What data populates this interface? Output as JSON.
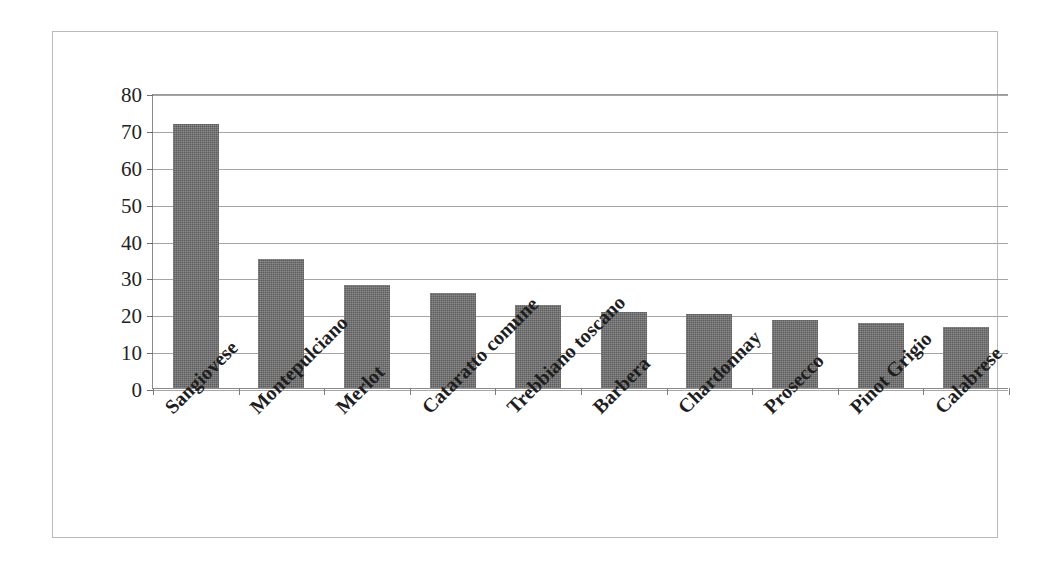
{
  "chart_data": {
    "type": "bar",
    "title": "",
    "subtitle": "",
    "xlabel": "",
    "ylabel": "",
    "ylim": [
      0,
      80
    ],
    "ytick_values": [
      80,
      70,
      60,
      50,
      40,
      30,
      20,
      10,
      0
    ],
    "ytick_labels": [
      "80",
      "70",
      "60",
      "50",
      "40",
      "30",
      "20",
      "10",
      "0"
    ],
    "grid": "horizontal",
    "legend": "none",
    "bar_color": "#5d5d5d",
    "categories": [
      "Sangiovese",
      "Montepulciano",
      "Merlot",
      "Cataratto comune",
      "Trebbiano toscano",
      "Barbera",
      "Chardonnay",
      "Prosecco",
      "Pinot Grigio",
      "Calabrese"
    ],
    "values": [
      71.7,
      34.9,
      28.0,
      25.8,
      22.5,
      20.6,
      20.1,
      18.4,
      17.5,
      16.6
    ],
    "series": [
      {
        "name": "",
        "values": [
          71.7,
          34.9,
          28.0,
          25.8,
          22.5,
          20.6,
          20.1,
          18.4,
          17.5,
          16.6
        ]
      }
    ]
  },
  "figure": {
    "border_color": "#b9b9b9",
    "background": "#ffffff",
    "axis_color": "#8a8a8a",
    "gridline_color": "#a5a5a5"
  }
}
